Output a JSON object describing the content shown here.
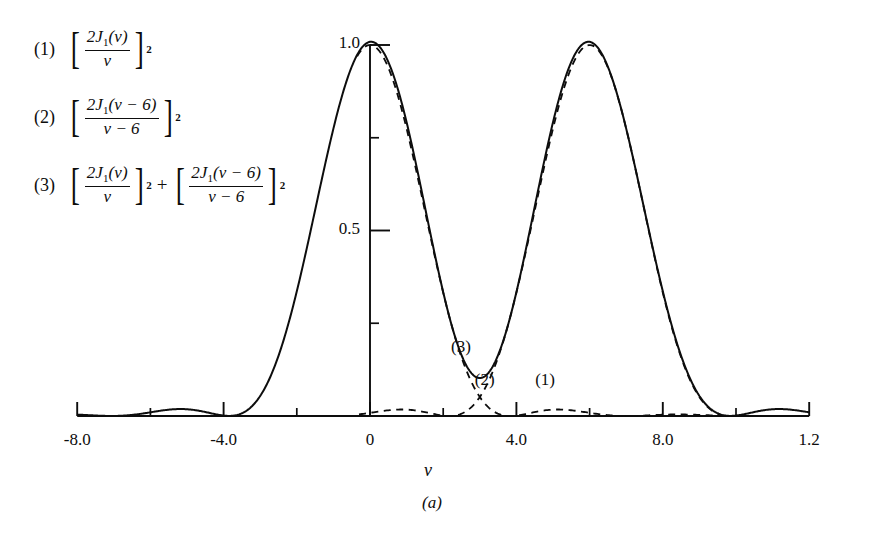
{
  "figure": {
    "caption": "(a)",
    "xlabel": "v",
    "background": "#ffffff",
    "ink": "#0d0d0d"
  },
  "legend": {
    "items": [
      {
        "number": "(1)",
        "numerator": "2J",
        "num_sub": "1",
        "num_arg": "(v)",
        "denominator": "v",
        "exponent": "2",
        "plain": "[2J1(v)/v]^2"
      },
      {
        "number": "(2)",
        "numerator": "2J",
        "num_sub": "1",
        "num_arg": "(v − 6)",
        "denominator": "v − 6",
        "exponent": "2",
        "plain": "[2J1(v-6)/(v-6)]^2"
      },
      {
        "number": "(3)",
        "plus": "+",
        "term1": {
          "numerator": "2J",
          "num_sub": "1",
          "num_arg": "(v)",
          "denominator": "v",
          "exponent": "2"
        },
        "term2": {
          "numerator": "2J",
          "num_sub": "1",
          "num_arg": "(v − 6)",
          "denominator": "v − 6",
          "exponent": "2"
        },
        "plain": "[2J1(v)/v]^2 + [2J1(v-6)/(v-6)]^2"
      }
    ]
  },
  "annotations": [
    {
      "text": "(2)",
      "x": 3.3,
      "y": 0.085
    },
    {
      "text": "(3)",
      "x": 2.65,
      "y": 0.175
    },
    {
      "text": "(1)",
      "x": 4.95,
      "y": 0.085
    }
  ],
  "chart_data": {
    "type": "line",
    "title": "",
    "xlabel": "v",
    "ylabel": "",
    "xlim": [
      -8.0,
      12.0
    ],
    "ylim": [
      0.0,
      1.05
    ],
    "grid": false,
    "legend_position": "outside-left",
    "x_ticks_major": [
      "-8.0",
      "-4.0",
      "0",
      "4.0",
      "8.0",
      "1.2"
    ],
    "x_tick_values": [
      -8,
      -4,
      0,
      4,
      8,
      12
    ],
    "x_ticks_minor": [
      -6,
      -2,
      2,
      6,
      10
    ],
    "y_ticks_major": [
      "1.0",
      "0.5"
    ],
    "y_tick_values": [
      1.0,
      0.5
    ],
    "y_ticks_minor": [
      0.25,
      0.75
    ],
    "series": [
      {
        "name": "(1)",
        "formula": "[2J1(v)/v]^2",
        "style": "dashed",
        "center": 0.0,
        "peak": 1.0,
        "first_zero_offset": 3.8317
      },
      {
        "name": "(2)",
        "formula": "[2J1(v-6)/(v-6)]^2",
        "style": "dashed",
        "center": 6.0,
        "peak": 1.0,
        "first_zero_offset": 3.8317
      },
      {
        "name": "(3)",
        "formula": "[2J1(v)/v]^2 + [2J1(v-6)/(v-6)]^2",
        "style": "solid",
        "peak": 1.0,
        "dip_x": 3.0,
        "dip_y": 0.12
      }
    ]
  }
}
